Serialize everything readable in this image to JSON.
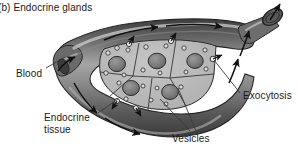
{
  "figure": {
    "caption": "(b) Endocrine glands",
    "background_color": "#ffffff",
    "text_color": "#1a1a1a",
    "width": 298,
    "height": 153
  },
  "labels": {
    "blood": "Blood",
    "endocrine_tissue_line1": "Endocrine",
    "endocrine_tissue_line2": "tissue",
    "vesicles": "Vesicles",
    "exocytosis": "Exocytosis"
  },
  "colors": {
    "vessel_dark": "#4f4f4f",
    "vessel_mid": "#6e6e6e",
    "vessel_light": "#a8a8a8",
    "vessel_highlight": "#c9c9c9",
    "vessel_outline": "#2b2b2b",
    "tissue_fill": "#b9b9b9",
    "tissue_outline": "#2b2b2b",
    "nucleus_fill": "#7d7d7d",
    "nucleus_outline": "#303030",
    "vesicle_fill": "#d6d6d6",
    "vesicle_outline": "#2b2b2b",
    "arrow": "#111111",
    "leader_line": "#3a3a3a"
  },
  "diagram": {
    "type": "biology-schematic",
    "structures": [
      "blood vessel lumen",
      "endocrine tissue cell cluster",
      "cell nuclei",
      "secretory vesicles",
      "exocytosis site",
      "blood flow arrows",
      "vessel outlet opening"
    ],
    "cells": [
      {
        "id": "cell-1",
        "nucleus": true,
        "vesicle_count": 5
      },
      {
        "id": "cell-2",
        "nucleus": true,
        "vesicle_count": 5
      },
      {
        "id": "cell-3",
        "nucleus": true,
        "vesicle_count": 4
      },
      {
        "id": "cell-4",
        "nucleus": true,
        "vesicle_count": 4
      },
      {
        "id": "cell-5",
        "nucleus": true,
        "vesicle_count": 4
      }
    ],
    "flow_arrow_count": 9,
    "exocytosis_site_count": 5
  }
}
